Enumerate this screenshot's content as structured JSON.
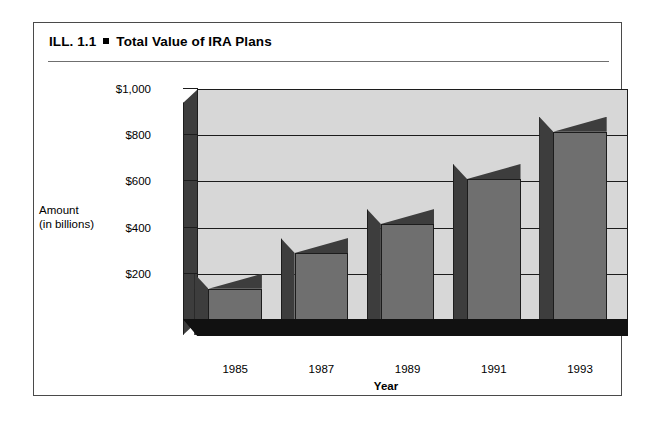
{
  "figure": {
    "label": "ILL. 1.1",
    "bullet": "square-bullet",
    "title": "Total Value of IRA Plans"
  },
  "chart_data": {
    "type": "bar",
    "title": "Total Value of IRA Plans",
    "categories": [
      "1985",
      "1987",
      "1989",
      "1991",
      "1993"
    ],
    "values": [
      200,
      355,
      480,
      675,
      880
    ],
    "xlabel": "Year",
    "ylabel": "Amount\n(in billions)",
    "ylabel_line1": "Amount",
    "ylabel_line2": "(in billions)",
    "ytick_labels": [
      "$200",
      "$400",
      "$600",
      "$800",
      "$1,000"
    ],
    "ytick_values": [
      200,
      400,
      600,
      800,
      1000
    ],
    "ylim": [
      0,
      1000
    ],
    "grid": true,
    "legend": "none",
    "style": "3d-bar",
    "colors": {
      "bar_front": "#6f6f6f",
      "bar_side": "#3d3d3d",
      "bar_top": "#555555",
      "back_wall": "#d7d7d7",
      "floor": "#111111",
      "outline": "#1c1c1c",
      "frame": "#4a4a4a"
    }
  }
}
